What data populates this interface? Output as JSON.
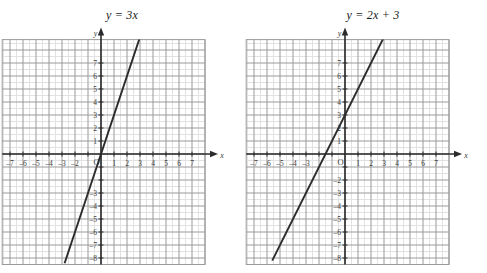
{
  "figure": {
    "name": "two-linear-graphs",
    "background": "#ffffff",
    "width": 487,
    "height": 273
  },
  "style": {
    "minor_grid_color": "#e2e2e2",
    "major_grid_color": "#9a9a9a",
    "axis_color": "#2b2b2b",
    "line_color": "#2b2b2b",
    "label_color": "#3a3a3a",
    "title_color": "#1a1a1a"
  },
  "charts": [
    {
      "id": "chart-left",
      "title": "y = 3x",
      "title_parts": {
        "lhs": "y",
        "eq": "=",
        "rhs": "3x"
      },
      "origin_label": "O",
      "x_axis_label": "x",
      "y_axis_label": "y",
      "x_tick_labels": [
        "–7",
        "–6",
        "–5",
        "–4",
        "–3",
        "–2",
        "",
        "1",
        "2",
        "3",
        "4",
        "5",
        "6",
        "7"
      ],
      "x_tick_values": [
        -7,
        -6,
        -5,
        -4,
        -3,
        -2,
        -1,
        1,
        2,
        3,
        4,
        5,
        6,
        7
      ],
      "y_tick_labels": [
        "7",
        "6",
        "5",
        "4",
        "3",
        "2",
        "1",
        "",
        "",
        "–3",
        "–4",
        "–5",
        "–6",
        "–7",
        "–8"
      ],
      "y_tick_values": [
        7,
        6,
        5,
        4,
        3,
        2,
        1,
        -1,
        -2,
        -3,
        -4,
        -5,
        -6,
        -7,
        -8
      ]
    },
    {
      "id": "chart-right",
      "title": "y = 2x + 3",
      "title_parts": {
        "lhs": "y",
        "eq": "=",
        "rhs": "2x + 3"
      },
      "origin_label": "O",
      "x_axis_label": "x",
      "y_axis_label": "y",
      "x_tick_labels": [
        "–7",
        "–6",
        "–5",
        "–4",
        "–3",
        "",
        "",
        "1",
        "2",
        "3",
        "4",
        "5",
        "6",
        "7"
      ],
      "x_tick_values": [
        -7,
        -6,
        -5,
        -4,
        -3,
        -2,
        -1,
        1,
        2,
        3,
        4,
        5,
        6,
        7
      ],
      "y_tick_labels": [
        "7",
        "6",
        "5",
        "4",
        "3",
        "2",
        "1",
        "",
        "–2",
        "–3",
        "–4",
        "–5",
        "–6",
        "–7",
        "–8"
      ],
      "y_tick_values": [
        7,
        6,
        5,
        4,
        3,
        2,
        1,
        -1,
        -2,
        -3,
        -4,
        -5,
        -6,
        -7,
        -8
      ]
    }
  ],
  "chart_data": [
    {
      "type": "line",
      "id": "chart-left",
      "title": "y = 3x",
      "xlabel": "x",
      "ylabel": "y",
      "xlim": [
        -7.6,
        8.0
      ],
      "ylim": [
        -8.5,
        8.8
      ],
      "grid": true,
      "grid_major_step": 1,
      "grid_minor_step": 0.5,
      "legend": "none",
      "equation": "y = 3x",
      "slope": 3,
      "intercept": 0,
      "series": [
        {
          "name": "y = 3x",
          "color": "#2b2b2b",
          "x": [
            -2.8,
            3.6
          ],
          "values": [
            -8.4,
            10.8
          ],
          "points": [
            [
              -2.8,
              -8.4
            ],
            [
              -2,
              -6
            ],
            [
              -1,
              -3
            ],
            [
              0,
              0
            ],
            [
              1,
              3
            ],
            [
              2,
              6
            ],
            [
              3,
              9
            ]
          ]
        }
      ],
      "annotations": [
        "passes through origin",
        "slope 3"
      ]
    },
    {
      "type": "line",
      "id": "chart-right",
      "title": "y = 2x + 3",
      "xlabel": "x",
      "ylabel": "y",
      "xlim": [
        -7.6,
        8.0
      ],
      "ylim": [
        -8.5,
        8.8
      ],
      "grid": true,
      "grid_major_step": 1,
      "grid_minor_step": 0.5,
      "legend": "none",
      "equation": "y = 2x + 3",
      "slope": 2,
      "intercept": 3,
      "series": [
        {
          "name": "y = 2x + 3",
          "color": "#2b2b2b",
          "x": [
            -5.6,
            4.1
          ],
          "values": [
            -8.2,
            11.2
          ],
          "points": [
            [
              -5.6,
              -8.2
            ],
            [
              -4,
              -5
            ],
            [
              -3,
              -3
            ],
            [
              -1.5,
              0
            ],
            [
              0,
              3
            ],
            [
              1,
              5
            ],
            [
              2,
              7
            ],
            [
              3,
              9
            ]
          ]
        }
      ],
      "annotations": [
        "y-intercept 3",
        "x-intercept -1.5",
        "slope 2"
      ]
    }
  ]
}
